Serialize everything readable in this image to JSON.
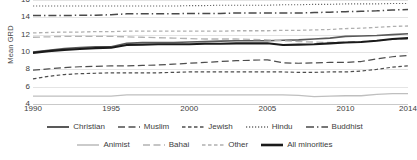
{
  "chart_data": {
    "type": "line",
    "title": "",
    "xlabel": "",
    "ylabel": "Mean GRD",
    "xlim": [
      1990,
      2014
    ],
    "ylim": [
      4,
      16
    ],
    "yticks": [
      4,
      6,
      8,
      10,
      12,
      14,
      16
    ],
    "xticks": [
      1990,
      1995,
      2000,
      2005,
      2010,
      2014
    ],
    "xtick_labels": [
      "1990",
      "1995",
      "2000",
      "2005",
      "2010",
      "2014"
    ],
    "ytick_labels": [
      "4",
      "6",
      "8",
      "10",
      "12",
      "14",
      "16"
    ],
    "grid": "horizontal",
    "legend_position": "bottom",
    "x": [
      1990,
      1991,
      1992,
      1993,
      1994,
      1995,
      1996,
      1997,
      1998,
      1999,
      2000,
      2001,
      2002,
      2003,
      2004,
      2005,
      2006,
      2007,
      2008,
      2009,
      2010,
      2011,
      2012,
      2013,
      2014
    ],
    "series": [
      {
        "name": "Christian",
        "style": "solid",
        "color": "#595959",
        "width": 1.6,
        "values": [
          10.0,
          10.2,
          10.4,
          10.5,
          10.6,
          10.6,
          11.0,
          11.1,
          11.1,
          11.1,
          11.15,
          11.2,
          11.25,
          11.3,
          11.3,
          11.3,
          11.35,
          11.4,
          11.5,
          11.6,
          11.8,
          11.85,
          11.9,
          12.0,
          12.1
        ]
      },
      {
        "name": "Muslim",
        "style": "long-dash",
        "color": "#4d4d4d",
        "width": 1.2,
        "values": [
          7.9,
          8.05,
          8.2,
          8.3,
          8.35,
          8.4,
          8.4,
          8.45,
          8.5,
          8.6,
          8.7,
          8.8,
          8.9,
          9.0,
          9.05,
          9.1,
          8.75,
          8.7,
          8.75,
          8.8,
          8.8,
          8.9,
          9.2,
          9.45,
          9.6
        ]
      },
      {
        "name": "Jewish",
        "style": "dash",
        "color": "#4d4d4d",
        "width": 1.2,
        "values": [
          6.9,
          7.2,
          7.4,
          7.5,
          7.55,
          7.6,
          7.6,
          7.6,
          7.6,
          7.65,
          7.7,
          7.7,
          7.7,
          7.7,
          7.7,
          7.7,
          7.7,
          7.65,
          7.65,
          7.7,
          7.7,
          7.8,
          8.0,
          8.25,
          8.4
        ]
      },
      {
        "name": "Hindu",
        "style": "dotted",
        "color": "#6b6b6b",
        "width": 1.1,
        "values": [
          15.3,
          15.3,
          15.3,
          15.3,
          15.3,
          15.3,
          15.3,
          15.3,
          15.3,
          15.3,
          15.35,
          15.35,
          15.4,
          15.4,
          15.4,
          15.4,
          15.45,
          15.45,
          15.5,
          15.5,
          15.55,
          15.55,
          15.55,
          15.6,
          15.6
        ]
      },
      {
        "name": "Buddhist",
        "style": "dash-dot",
        "color": "#4a4a4a",
        "width": 1.5,
        "values": [
          14.2,
          14.2,
          14.2,
          14.25,
          14.25,
          14.3,
          14.4,
          14.4,
          14.4,
          14.4,
          14.45,
          14.45,
          14.45,
          14.5,
          14.5,
          14.5,
          14.5,
          14.5,
          14.55,
          14.6,
          14.65,
          14.7,
          14.75,
          14.85,
          14.9
        ]
      },
      {
        "name": "Animist",
        "style": "solid",
        "color": "#bfbfbf",
        "width": 1.3,
        "values": [
          4.9,
          4.9,
          4.9,
          4.9,
          4.9,
          4.9,
          5.05,
          5.05,
          5.05,
          5.05,
          5.05,
          5.05,
          5.05,
          5.05,
          5.05,
          5.05,
          5.05,
          5.0,
          4.85,
          4.9,
          4.95,
          4.95,
          5.1,
          5.2,
          5.2
        ]
      },
      {
        "name": "Bahai",
        "style": "long-dash",
        "color": "#b3b3b3",
        "width": 1.3,
        "values": [
          11.7,
          11.75,
          11.8,
          11.8,
          11.8,
          11.8,
          11.75,
          11.7,
          11.65,
          11.6,
          11.55,
          11.5,
          11.5,
          11.5,
          11.45,
          11.4,
          11.3,
          11.2,
          11.15,
          11.1,
          11.15,
          11.2,
          11.3,
          11.45,
          11.5
        ]
      },
      {
        "name": "Other",
        "style": "dash",
        "color": "#b0b0b0",
        "width": 1.3,
        "values": [
          12.2,
          12.25,
          12.3,
          12.3,
          12.35,
          12.35,
          12.4,
          12.4,
          12.4,
          12.4,
          12.4,
          12.4,
          12.4,
          12.45,
          12.45,
          12.45,
          12.5,
          12.5,
          12.55,
          12.6,
          12.7,
          12.75,
          12.85,
          12.95,
          13.0
        ]
      },
      {
        "name": "All minorities",
        "style": "solid",
        "color": "#1a1a1a",
        "width": 2.1,
        "values": [
          9.9,
          10.1,
          10.25,
          10.35,
          10.45,
          10.5,
          10.8,
          10.85,
          10.9,
          10.9,
          10.9,
          10.95,
          10.95,
          11.0,
          11.0,
          11.0,
          10.8,
          10.85,
          10.9,
          11.0,
          11.1,
          11.15,
          11.3,
          11.5,
          11.6
        ]
      }
    ]
  },
  "legend": {
    "rows": [
      [
        {
          "label": "Christian",
          "style": "solid",
          "color": "#595959",
          "width": 2.0
        },
        {
          "label": "Muslim",
          "style": "long-dash",
          "color": "#4d4d4d",
          "width": 1.4
        },
        {
          "label": "Jewish",
          "style": "dash",
          "color": "#4d4d4d",
          "width": 1.4
        },
        {
          "label": "Hindu",
          "style": "dotted",
          "color": "#6b6b6b",
          "width": 1.3
        },
        {
          "label": "Buddhist",
          "style": "dash-dot",
          "color": "#4a4a4a",
          "width": 1.7
        }
      ],
      [
        {
          "label": "Animist",
          "style": "solid",
          "color": "#bfbfbf",
          "width": 1.6
        },
        {
          "label": "Bahai",
          "style": "long-dash",
          "color": "#b3b3b3",
          "width": 1.5
        },
        {
          "label": "Other",
          "style": "dash",
          "color": "#b0b0b0",
          "width": 1.5
        },
        {
          "label": "All minorities",
          "style": "solid",
          "color": "#1a1a1a",
          "width": 2.6
        }
      ]
    ]
  }
}
